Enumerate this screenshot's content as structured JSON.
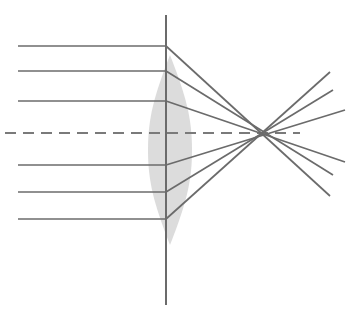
{
  "figure": {
    "type": "optics-ray-diagram",
    "canvas": {
      "width": 357,
      "height": 320,
      "background": "#ffffff"
    }
  },
  "colors": {
    "ray_stroke": "#6b6b6b",
    "axis_stroke": "#6b6b6b",
    "dashed_axis_stroke": "#7a7a7a",
    "lens_fill": "#dcdcdc",
    "lens_stroke": "none",
    "background": "#ffffff"
  },
  "strokes": {
    "ray_width": 1.7,
    "axis_width": 2.0,
    "dashed_axis_width": 2.0,
    "dash_pattern": "11 7"
  },
  "lens": {
    "label": "biconvex-lens",
    "center_x": 170,
    "top_y": 55,
    "bottom_y": 245,
    "half_width": 22,
    "left_edge_x": 148,
    "right_edge_x": 192,
    "fill": "#dcdcdc",
    "path": "M 170 55 C 186 96 192 118 192 150 C 192 182 186 204 170 245 C 154 204 148 182 148 150 C 148 118 154 96 170 55 Z"
  },
  "vertical_axis": {
    "label": "lens-plane-axis",
    "x": 166,
    "y1": 15,
    "y2": 305
  },
  "optical_axis": {
    "label": "optical-axis",
    "y": 133,
    "x1": 5,
    "x2": 300,
    "style": "dashed"
  },
  "refraction_plane_x": 166,
  "incoming_rays": [
    {
      "id": "ray-1",
      "position": "marginal-upper",
      "height_y": 46,
      "x_start": 18,
      "x_end": 166
    },
    {
      "id": "ray-2",
      "position": "zonal-upper",
      "height_y": 71,
      "x_start": 18,
      "x_end": 166
    },
    {
      "id": "ray-3",
      "position": "paraxial-upper",
      "height_y": 101,
      "x_start": 18,
      "x_end": 166
    },
    {
      "id": "ray-4",
      "position": "paraxial-lower",
      "height_y": 165,
      "x_start": 18,
      "x_end": 166
    },
    {
      "id": "ray-5",
      "position": "zonal-lower",
      "height_y": 192,
      "x_start": 18,
      "x_end": 166
    },
    {
      "id": "ray-6",
      "position": "marginal-lower",
      "height_y": 219,
      "x_start": 18,
      "x_end": 166
    }
  ],
  "refracted_rays": [
    {
      "id": "refracted-1",
      "from_ray": "ray-1",
      "x1": 166,
      "y1": 46,
      "x2": 330,
      "y2": 196,
      "crossing_x": 266
    },
    {
      "id": "refracted-2",
      "from_ray": "ray-2",
      "x1": 166,
      "y1": 71,
      "x2": 333,
      "y2": 175,
      "crossing_x": 271
    },
    {
      "id": "refracted-3",
      "from_ray": "ray-3",
      "x1": 166,
      "y1": 101,
      "x2": 345,
      "y2": 162,
      "crossing_x": 295
    },
    {
      "id": "refracted-4",
      "from_ray": "ray-4",
      "x1": 166,
      "y1": 165,
      "x2": 345,
      "y2": 110,
      "crossing_x": 295
    },
    {
      "id": "refracted-5",
      "from_ray": "ray-5",
      "x1": 166,
      "y1": 192,
      "x2": 333,
      "y2": 90,
      "crossing_x": 271
    },
    {
      "id": "refracted-6",
      "from_ray": "ray-6",
      "x1": 166,
      "y1": 219,
      "x2": 330,
      "y2": 72,
      "crossing_x": 266
    }
  ],
  "annotations": {
    "description": "Six parallel rays strike a biconvex lens; marginal rays focus closer to the lens than paraxial rays, producing a caustic rather than a single focal point.",
    "caustic_region": {
      "x_near": 262,
      "x_far": 300,
      "y_center": 133
    }
  }
}
